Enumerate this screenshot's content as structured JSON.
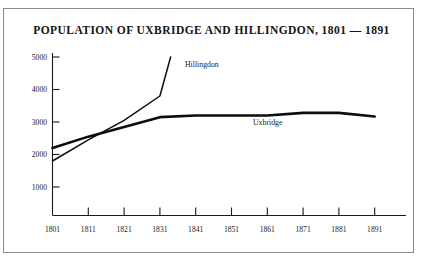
{
  "chart_data": {
    "type": "line",
    "title": "POPULATION OF UXBRIDGE AND HILLINGDON, 1801 — 1891",
    "xlabel": "",
    "ylabel": "",
    "x": [
      1801,
      1811,
      1821,
      1831,
      1841,
      1851,
      1861,
      1871,
      1881,
      1891
    ],
    "xticklabels": [
      "1801",
      "1811",
      "1821",
      "1831",
      "1841",
      "1851",
      "1861",
      "1871",
      "1881",
      "1891"
    ],
    "yticklabels": [
      "1000",
      "2000",
      "3000",
      "4000",
      "5000"
    ],
    "yticks": [
      1000,
      2000,
      3000,
      4000,
      5000
    ],
    "xlim": [
      1801,
      1891
    ],
    "ylim": [
      0,
      5000
    ],
    "grid": false,
    "legend": "inline-labels",
    "series": [
      {
        "name": "Uxbridge",
        "label": "Uxbridge",
        "color": "#0d0d0d",
        "x": [
          1801,
          1811,
          1821,
          1831,
          1841,
          1851,
          1861,
          1871,
          1881,
          1891
        ],
        "values": [
          2200,
          2550,
          2850,
          3150,
          3200,
          3200,
          3200,
          3280,
          3280,
          3170
        ]
      },
      {
        "name": "Hillingdon",
        "label": "Hillingdon",
        "color": "#0d0d0d",
        "x": [
          1801,
          1811,
          1821,
          1831,
          1834
        ],
        "values": [
          1800,
          2450,
          3050,
          3800,
          5000
        ]
      }
    ],
    "annotations": [
      {
        "text": "Hillingdon",
        "x": 1838,
        "y": 4700
      },
      {
        "text": "Uxbridge",
        "x": 1857,
        "y": 2900
      }
    ]
  }
}
